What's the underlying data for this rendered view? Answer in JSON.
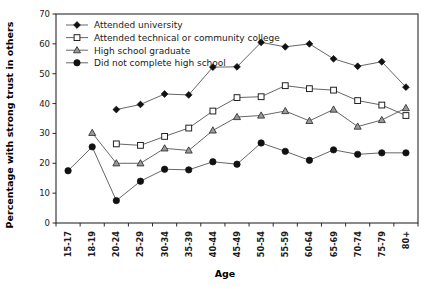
{
  "chart_data": {
    "type": "line",
    "title": "",
    "xlabel": "Age",
    "ylabel": "Percentage with strong trust in others",
    "categories": [
      "15-17",
      "18-19",
      "20-24",
      "25-29",
      "30-34",
      "35-39",
      "40-44",
      "45-49",
      "50-54",
      "55-59",
      "60-64",
      "65-69",
      "70-74",
      "75-79",
      "80+"
    ],
    "ylim": [
      0,
      70
    ],
    "yticks": [
      0,
      10,
      20,
      30,
      40,
      50,
      60,
      70
    ],
    "grid": false,
    "legend_position": "top-left",
    "series": [
      {
        "name": "Attended university",
        "marker": "filled-diamond",
        "values": [
          null,
          null,
          38.0,
          39.7,
          43.2,
          42.9,
          52.2,
          52.3,
          60.5,
          59.0,
          60.0,
          55.0,
          52.5,
          54.0,
          45.5
        ]
      },
      {
        "name": "Attended technical or community college",
        "marker": "open-square",
        "values": [
          null,
          null,
          26.5,
          26.0,
          29.0,
          31.8,
          37.5,
          42.0,
          42.3,
          46.0,
          45.0,
          44.5,
          41.0,
          39.5,
          36.0
        ]
      },
      {
        "name": "High school graduate",
        "marker": "shaded-triangle",
        "values": [
          null,
          30.2,
          20.0,
          20.0,
          25.0,
          24.3,
          31.0,
          35.5,
          36.0,
          37.5,
          34.2,
          38.0,
          32.3,
          34.5,
          38.5
        ]
      },
      {
        "name": "Did not complete high school",
        "marker": "filled-circle",
        "values": [
          17.5,
          25.5,
          7.5,
          14.0,
          18.0,
          17.8,
          20.5,
          19.7,
          26.8,
          24.0,
          21.0,
          24.5,
          23.0,
          23.5,
          23.5
        ]
      }
    ]
  },
  "legend": {
    "items": [
      {
        "label": "Attended university"
      },
      {
        "label": "Attended technical or community college"
      },
      {
        "label": "High school graduate"
      },
      {
        "label": "Did not complete high school"
      }
    ]
  }
}
